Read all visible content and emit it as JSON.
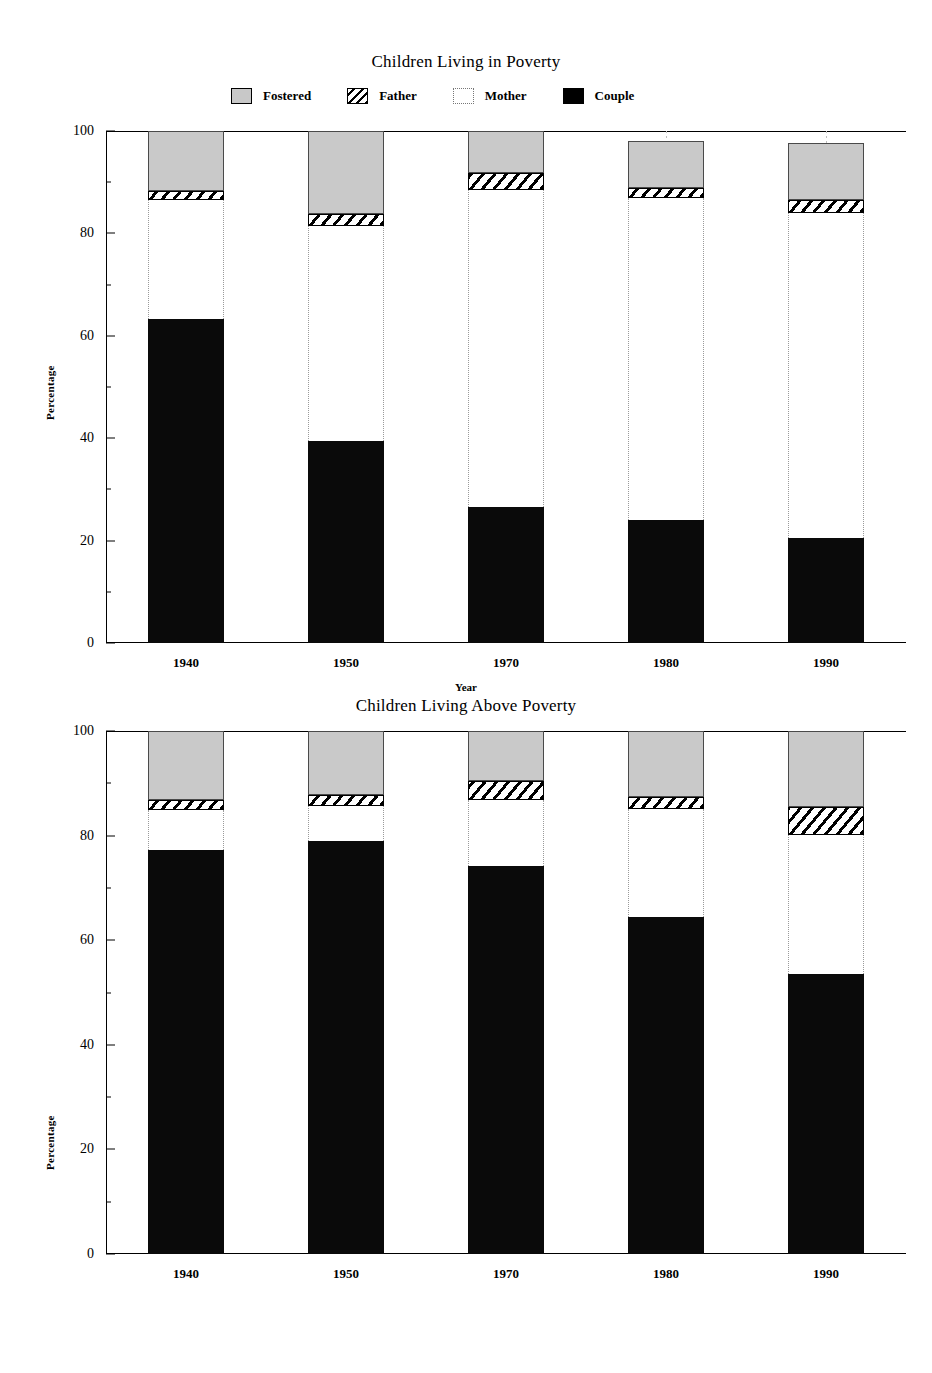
{
  "legend": {
    "items": [
      {
        "label": "Fostered",
        "swatch": "fostered-swatch",
        "color": "#c8c8c8"
      },
      {
        "label": "Father",
        "swatch": "father-swatch",
        "color": "#000000"
      },
      {
        "label": "Mother",
        "swatch": "mother-swatch",
        "color": "#ffffff"
      },
      {
        "label": "Couple",
        "swatch": "couple-swatch",
        "color": "#000000"
      }
    ]
  },
  "chart_data": [
    {
      "type": "bar",
      "id": "children-living-in-poverty",
      "title": "Children Living in Poverty",
      "xlabel": "Year",
      "ylabel": "Percentage",
      "ylim": [
        0,
        100
      ],
      "yticks": [
        0,
        20,
        40,
        60,
        80,
        100
      ],
      "grid": false,
      "stacked": true,
      "legend_position": "top",
      "categories": [
        "1940",
        "1950",
        "1970",
        "1980",
        "1990"
      ],
      "series": [
        {
          "name": "Couple",
          "values": [
            63.3,
            39.5,
            26.5,
            24.0,
            20.5
          ]
        },
        {
          "name": "Mother",
          "values": [
            23.2,
            42.0,
            62.0,
            63.0,
            63.5
          ]
        },
        {
          "name": "Father",
          "values": [
            1.7,
            2.2,
            3.3,
            1.9,
            2.5
          ]
        },
        {
          "name": "Fostered",
          "values": [
            11.8,
            16.3,
            8.2,
            9.1,
            11.1
          ]
        }
      ]
    },
    {
      "type": "bar",
      "id": "children-living-above-poverty",
      "title": "Children Living Above Poverty",
      "xlabel": "",
      "ylabel": "Percentage",
      "ylim": [
        0,
        100
      ],
      "yticks": [
        0,
        20,
        40,
        60,
        80,
        100
      ],
      "grid": false,
      "stacked": true,
      "legend_position": "none",
      "categories": [
        "1940",
        "1950",
        "1970",
        "1980",
        "1990"
      ],
      "series": [
        {
          "name": "Couple",
          "values": [
            77.3,
            79.0,
            74.2,
            64.4,
            53.5
          ]
        },
        {
          "name": "Mother",
          "values": [
            7.6,
            6.6,
            12.6,
            20.6,
            26.7
          ]
        },
        {
          "name": "Father",
          "values": [
            1.9,
            2.1,
            3.6,
            2.3,
            5.3
          ]
        },
        {
          "name": "Fostered",
          "values": [
            13.2,
            12.3,
            9.6,
            12.7,
            14.5
          ]
        }
      ]
    }
  ]
}
